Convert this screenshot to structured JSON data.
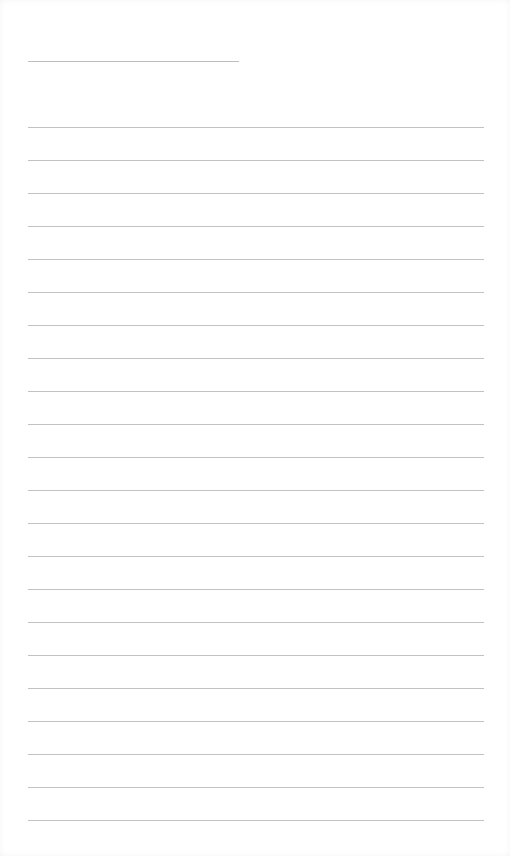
{
  "page": {
    "type": "lined-notepad",
    "title": "",
    "title_line": {
      "y": 61,
      "x": 28,
      "width": 211
    },
    "rules": {
      "count": 22,
      "start_y": 127,
      "spacing": 33,
      "x": 28,
      "width": 456,
      "color": "#c2c2c2"
    },
    "lines_text": []
  }
}
